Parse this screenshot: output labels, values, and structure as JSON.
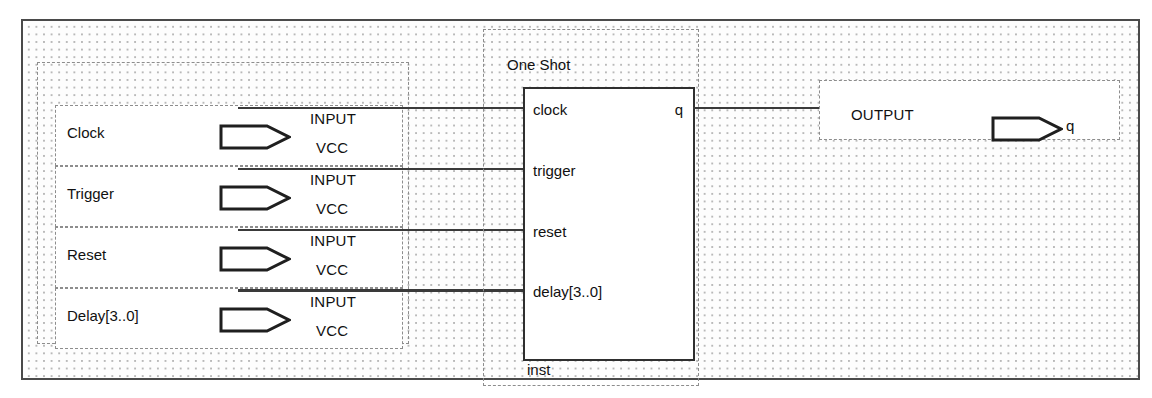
{
  "diagram": {
    "grid": "dotted",
    "colors": {
      "frame": "#4a4a4a",
      "wire": "#3a3a3a",
      "dash": "#8d8d8d",
      "text": "#111111",
      "background": "#fdfdfd"
    }
  },
  "inputs": {
    "pin_type_top": "INPUT",
    "pin_type_bottom": "VCC",
    "rows": [
      {
        "label": "Clock",
        "bus": false
      },
      {
        "label": "Trigger",
        "bus": false
      },
      {
        "label": "Reset",
        "bus": false
      },
      {
        "label": "Delay[3..0]",
        "bus": true
      }
    ]
  },
  "oneshot": {
    "title": "One Shot",
    "instance": "inst",
    "ports_left": [
      {
        "name": "clock"
      },
      {
        "name": "trigger"
      },
      {
        "name": "reset"
      },
      {
        "name": "delay[3..0]"
      }
    ],
    "ports_right": [
      {
        "name": "q"
      }
    ]
  },
  "output": {
    "pin_type": "OUTPUT",
    "name": "q"
  }
}
